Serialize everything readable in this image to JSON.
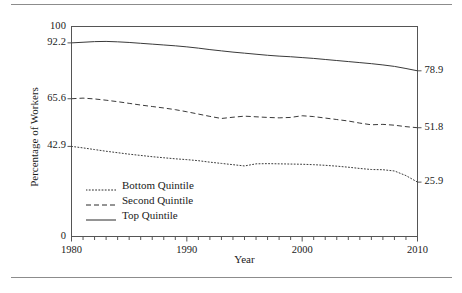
{
  "figure": {
    "has_top_rule": true,
    "has_bottom_rule": true,
    "rule_color": "#8c8c8c",
    "line_color": "#2b2b2b",
    "axis_color": "#555555"
  },
  "chart_data": {
    "type": "line",
    "title": "",
    "xlabel": "Year",
    "ylabel": "Percentage of Workers",
    "xlim": [
      1980,
      2010
    ],
    "ylim": [
      0,
      100
    ],
    "grid": false,
    "legend_position": "lower-left-inside",
    "y_tick_labels_left": [
      "100",
      "92.2",
      "65.6",
      "42.9",
      "0"
    ],
    "y_tick_values_left": [
      100,
      92.2,
      65.6,
      42.9,
      0
    ],
    "y_tick_labels_right": [
      "78.9",
      "51.8",
      "25.9"
    ],
    "y_tick_values_right": [
      78.9,
      51.8,
      25.9
    ],
    "x_tick_labels": [
      "1980",
      "1990",
      "2000",
      "2010"
    ],
    "x_tick_values": [
      1980,
      1990,
      2000,
      2010
    ],
    "x_minor_tick_step": 1,
    "x": [
      1980,
      1981,
      1982,
      1983,
      1984,
      1985,
      1986,
      1987,
      1988,
      1989,
      1990,
      1991,
      1992,
      1993,
      1994,
      1995,
      1996,
      1997,
      1998,
      1999,
      2000,
      2001,
      2002,
      2003,
      2004,
      2005,
      2006,
      2007,
      2008,
      2009,
      2010
    ],
    "series": [
      {
        "name": "Bottom Quintile",
        "style": "dotted",
        "color": "#3a3a3a",
        "start_value": 42.9,
        "end_value": 25.9,
        "values": [
          42.9,
          42.2,
          41.4,
          40.6,
          39.9,
          39.2,
          38.6,
          38.0,
          37.5,
          37.0,
          36.6,
          36.1,
          35.4,
          34.8,
          34.2,
          33.6,
          34.6,
          34.7,
          34.6,
          34.5,
          34.4,
          34.2,
          33.9,
          33.5,
          33.0,
          32.4,
          31.9,
          31.8,
          31.2,
          29.0,
          25.9
        ]
      },
      {
        "name": "Second Quintile",
        "style": "dashed",
        "color": "#3a3a3a",
        "start_value": 65.6,
        "end_value": 51.8,
        "values": [
          65.6,
          65.9,
          65.5,
          64.9,
          64.2,
          63.4,
          62.6,
          61.9,
          61.2,
          60.4,
          59.4,
          58.3,
          57.2,
          56.2,
          56.8,
          57.3,
          57.0,
          56.7,
          56.5,
          56.7,
          57.5,
          57.1,
          56.4,
          55.7,
          55.0,
          54.0,
          53.2,
          53.4,
          53.0,
          52.3,
          51.8
        ]
      },
      {
        "name": "Top Quintile",
        "style": "solid",
        "color": "#3a3a3a",
        "start_value": 92.2,
        "end_value": 78.9,
        "values": [
          92.2,
          92.5,
          92.8,
          92.9,
          92.7,
          92.4,
          92.0,
          91.6,
          91.2,
          90.8,
          90.3,
          89.7,
          89.0,
          88.4,
          87.8,
          87.3,
          86.8,
          86.3,
          85.9,
          85.6,
          85.2,
          84.8,
          84.3,
          83.8,
          83.3,
          82.8,
          82.3,
          81.7,
          81.0,
          80.0,
          78.9
        ]
      }
    ]
  },
  "legend": {
    "items": [
      {
        "label": "Bottom Quintile",
        "style": "dotted"
      },
      {
        "label": "Second Quintile",
        "style": "dashed"
      },
      {
        "label": "Top Quintile",
        "style": "solid"
      }
    ]
  }
}
